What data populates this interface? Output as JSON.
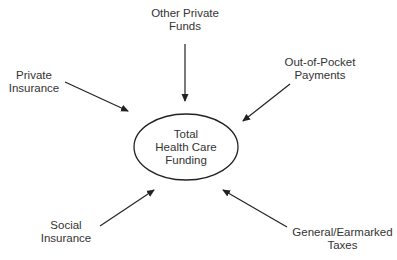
{
  "diagram": {
    "center": {
      "lines": [
        "Total",
        "Health Care",
        "Funding"
      ]
    },
    "sources": [
      {
        "id": "other-private-funds",
        "lines": [
          "Other Private",
          "Funds"
        ]
      },
      {
        "id": "private-insurance",
        "lines": [
          "Private",
          "Insurance"
        ]
      },
      {
        "id": "out-of-pocket-payments",
        "lines": [
          "Out-of-Pocket",
          "Payments"
        ]
      },
      {
        "id": "social-insurance",
        "lines": [
          "Social",
          "Insurance"
        ]
      },
      {
        "id": "general-earmarked-taxes",
        "lines": [
          "General/Earmarked",
          "Taxes"
        ]
      }
    ],
    "colors": {
      "line": "#222222",
      "text": "#333333",
      "background": "#ffffff"
    }
  }
}
